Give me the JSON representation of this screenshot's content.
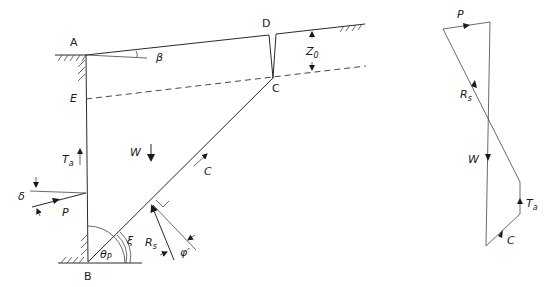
{
  "diagram": {
    "title": "",
    "wedge": {
      "points": {
        "A": "A",
        "B": "B",
        "C": "C",
        "D": "D",
        "E": "E"
      },
      "angles": {
        "beta": "β",
        "theta_p": "θ",
        "theta_p_sub": "P",
        "xi": "ξ",
        "delta": "δ",
        "phi": "φ′"
      },
      "forces": {
        "W": "W",
        "P": "P",
        "Ta": "T",
        "Ta_sub": "a",
        "C": "C",
        "Rs": "R",
        "Rs_sub": "s"
      },
      "depth": {
        "Z": "Z",
        "Z_sub": "0"
      }
    },
    "force_polygon": {
      "P": "P",
      "Rs": "R",
      "Rs_sub": "s",
      "W": "W",
      "Ta": "T",
      "Ta_sub": "a",
      "C": "C"
    },
    "colors": {
      "line": "#2a2a2a",
      "background": "#ffffff"
    }
  }
}
